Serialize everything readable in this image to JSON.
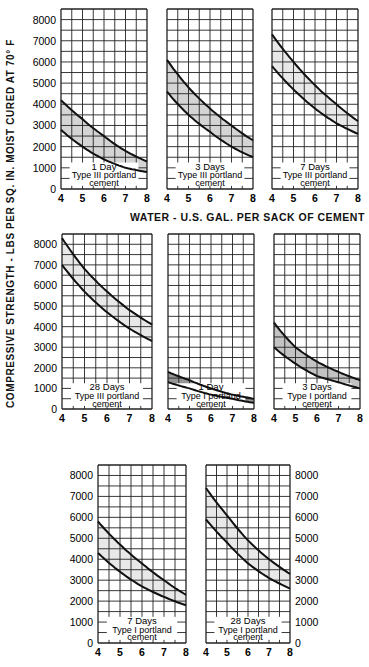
{
  "chart_data": {
    "type": "area",
    "title": "",
    "ylabel": "COMPRESSIVE   STRENGTH - LBS PER SQ. IN. MOIST CURED AT 70° F",
    "xlabel": "WATER - U.S. GAL. PER SACK OF CEMENT",
    "x": [
      4,
      5,
      6,
      7,
      8
    ],
    "xlim": [
      4,
      8
    ],
    "ylim": [
      0,
      8500
    ],
    "y_ticks": [
      0,
      1000,
      2000,
      3000,
      4000,
      5000,
      6000,
      7000,
      8000
    ],
    "x_ticks": [
      4,
      5,
      6,
      7,
      8
    ],
    "grid": true,
    "panels": [
      {
        "id": "1d-type3",
        "age": "1 Day",
        "cement": "Type III portland",
        "cement2": "cement",
        "row": 1,
        "col": 1,
        "upper": [
          4200,
          3300,
          2500,
          1800,
          1300
        ],
        "lower": [
          2800,
          2000,
          1400,
          1000,
          800
        ],
        "shade": "light"
      },
      {
        "id": "3d-type3",
        "age": "3 Days",
        "cement": "Type III portland",
        "cement2": "cement",
        "row": 1,
        "col": 2,
        "upper": [
          6100,
          4800,
          3800,
          3000,
          2300
        ],
        "lower": [
          4600,
          3500,
          2700,
          2000,
          1500
        ],
        "shade": "light"
      },
      {
        "id": "7d-type3",
        "age": "7 Days",
        "cement": "Type III portland",
        "cement2": "cement",
        "row": 1,
        "col": 3,
        "upper": [
          7300,
          6000,
          4900,
          4000,
          3200
        ],
        "lower": [
          5800,
          4700,
          3800,
          3100,
          2600
        ],
        "shade": "faint"
      },
      {
        "id": "28d-type3",
        "age": "28 Days",
        "cement": "Type III portland",
        "cement2": "cement",
        "row": 2,
        "col": 1,
        "upper": [
          8300,
          6800,
          5700,
          4800,
          4100
        ],
        "lower": [
          7000,
          5700,
          4700,
          3900,
          3300
        ],
        "shade": "faint"
      },
      {
        "id": "1d-type1",
        "age": "1 Day",
        "cement": "Type I portland",
        "cement2": "cement",
        "row": 2,
        "col": 2,
        "upper": [
          1800,
          1400,
          1000,
          700,
          500
        ],
        "lower": [
          1300,
          1000,
          700,
          500,
          300
        ],
        "shade": "dark"
      },
      {
        "id": "3d-type1",
        "age": "3 Days",
        "cement": "Type I portland",
        "cement2": "cement",
        "row": 2,
        "col": 3,
        "upper": [
          4200,
          3000,
          2300,
          1800,
          1400
        ],
        "lower": [
          3000,
          2200,
          1600,
          1300,
          1000
        ],
        "shade": "medium"
      },
      {
        "id": "7d-type1",
        "age": "7 Days",
        "cement": "Type I portland",
        "cement2": "cement",
        "row": 3,
        "col": 1,
        "upper": [
          5800,
          4700,
          3800,
          3000,
          2300
        ],
        "lower": [
          4300,
          3400,
          2700,
          2200,
          1800
        ],
        "shade": "faint"
      },
      {
        "id": "28d-type1",
        "age": "28 Days",
        "cement": "Type I portland",
        "cement2": "cement",
        "row": 3,
        "col": 2,
        "upper": [
          7400,
          6100,
          4900,
          4000,
          3300
        ],
        "lower": [
          5900,
          4800,
          3800,
          3100,
          2600
        ],
        "shade": "faint"
      }
    ]
  },
  "layout": {
    "panels_px": [
      {
        "x0": 61,
        "x1": 147,
        "y0": 9,
        "y1": 189,
        "ticks_left": true
      },
      {
        "x0": 167,
        "x1": 253,
        "y0": 9,
        "y1": 189,
        "ticks_left": false
      },
      {
        "x0": 272,
        "x1": 358,
        "y0": 9,
        "y1": 189,
        "ticks_left": false
      },
      {
        "x0": 62,
        "x1": 152,
        "y0": 234,
        "y1": 409,
        "ticks_left": true
      },
      {
        "x0": 168,
        "x1": 254,
        "y0": 234,
        "y1": 409,
        "ticks_left": false
      },
      {
        "x0": 274,
        "x1": 360,
        "y0": 234,
        "y1": 409,
        "ticks_left": false
      },
      {
        "x0": 98,
        "x1": 186,
        "y0": 465,
        "y1": 643,
        "ticks_left": true
      },
      {
        "x0": 206,
        "x1": 290,
        "y0": 465,
        "y1": 643,
        "ticks_right": true
      }
    ],
    "shade_colors": {
      "light": "#cfcfcf",
      "faint": "#e6e6e6",
      "dark": "#8a8a8a",
      "medium": "#bdbdbd"
    }
  }
}
